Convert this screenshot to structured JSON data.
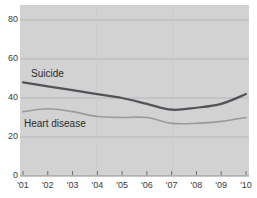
{
  "chart_data": {
    "type": "line",
    "title": "",
    "subtitle": "",
    "xlabel": "",
    "ylabel": "",
    "grid": true,
    "legend_position": "inline",
    "plot_background": "#d2d2d2",
    "page_background": "#ffffff",
    "x": [
      2001,
      2002,
      2003,
      2004,
      2005,
      2006,
      2007,
      2008,
      2009,
      2010
    ],
    "categories": [
      "'01",
      "'02",
      "'03",
      "'04",
      "'05",
      "'06",
      "'07",
      "'08",
      "'09",
      "'10"
    ],
    "xlim": [
      2001,
      2010
    ],
    "ylim": [
      0,
      88
    ],
    "yticks": [
      0,
      20,
      40,
      60,
      80
    ],
    "ytick_labels": [
      "0",
      "20",
      "40",
      "60",
      "80"
    ],
    "series": [
      {
        "name": "Suicide",
        "color": "#53535a",
        "line_width": 2.2,
        "values": [
          48,
          46,
          44,
          42,
          40,
          37,
          34,
          35,
          37,
          42
        ]
      },
      {
        "name": "Heart disease",
        "color": "#9a9a9a",
        "line_width": 1.6,
        "values": [
          33,
          34.5,
          33,
          30.5,
          30,
          30,
          27,
          27,
          28,
          30
        ]
      }
    ],
    "annotations": [
      {
        "text": "Suicide",
        "x": 2001.3,
        "y": 55
      },
      {
        "text": "Heart disease",
        "x": 2001.1,
        "y": 31
      }
    ]
  },
  "axes": {
    "y_tick_0": "0",
    "y_tick_20": "20",
    "y_tick_40": "40",
    "y_tick_60": "60",
    "y_tick_80": "80",
    "x_tick_01": "'01",
    "x_tick_02": "'02",
    "x_tick_03": "'03",
    "x_tick_04": "'04",
    "x_tick_05": "'05",
    "x_tick_06": "'06",
    "x_tick_07": "'07",
    "x_tick_08": "'08",
    "x_tick_09": "'09",
    "x_tick_10": "'10"
  },
  "labels": {
    "suicide": "Suicide",
    "heart_disease": "Heart disease"
  }
}
